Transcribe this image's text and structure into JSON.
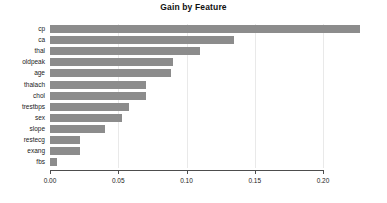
{
  "chart_data": {
    "type": "bar",
    "orientation": "horizontal",
    "title": "Gain by Feature",
    "xlabel": "",
    "ylabel": "",
    "categories": [
      "cp",
      "ca",
      "thal",
      "oldpeak",
      "age",
      "thalach",
      "chol",
      "trestbps",
      "sex",
      "slope",
      "restecg",
      "exang",
      "fbs"
    ],
    "values": [
      0.227,
      0.135,
      0.11,
      0.09,
      0.089,
      0.07,
      0.07,
      0.058,
      0.053,
      0.04,
      0.022,
      0.022,
      0.005
    ],
    "xlim": [
      0.0,
      0.2275
    ],
    "xticks": [
      0.0,
      0.05,
      0.1,
      0.15,
      0.2
    ],
    "xtick_labels": [
      "0.00",
      "0.05",
      "0.10",
      "0.15",
      "0.20"
    ],
    "grid": "vertical-only",
    "legend": null,
    "bar_color": "#8c8c8c",
    "grid_color": "#e9e9e9",
    "axis_color": "#4d4d4d"
  }
}
